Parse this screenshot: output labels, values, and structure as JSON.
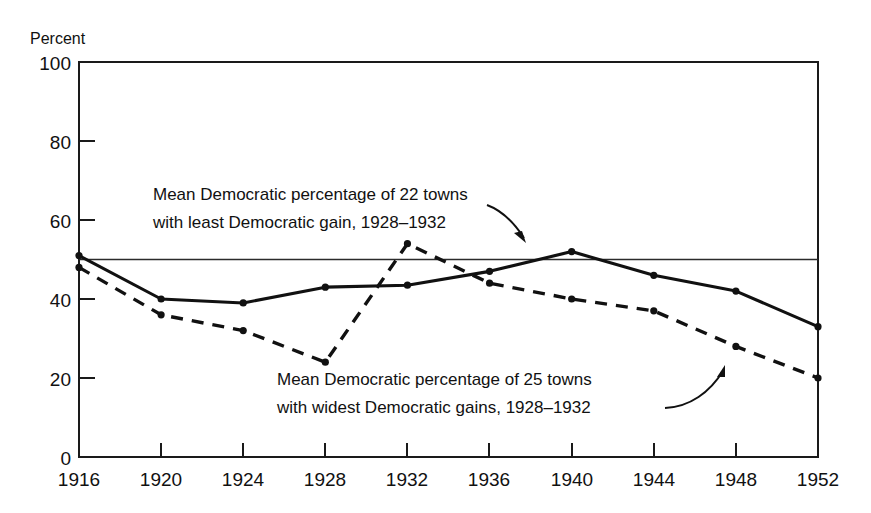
{
  "chart_data": {
    "type": "line",
    "title": "",
    "subtitle": "",
    "xlabel": "",
    "ylabel": "Percent",
    "ylim": [
      0,
      100
    ],
    "xlim": [
      1916,
      1952
    ],
    "grid": false,
    "legend_position": "annotations-inline",
    "x_tick_labels": [
      "1916",
      "1920",
      "1924",
      "1928",
      "1932",
      "1936",
      "1940",
      "1944",
      "1948",
      "1952"
    ],
    "y_tick_labels": [
      "0",
      "20",
      "40",
      "60",
      "80",
      "100"
    ],
    "x": [
      1916,
      1920,
      1924,
      1928,
      1932,
      1936,
      1940,
      1944,
      1948,
      1952
    ],
    "series": [
      {
        "name": "Mean Democratic percentage of 22 towns with least Democratic gain, 1928-1932",
        "style": "solid",
        "values": [
          51,
          40,
          39,
          43,
          43.5,
          47,
          52,
          46,
          42,
          33
        ]
      },
      {
        "name": "Mean Democratic percentage of 25 towns with widest Democratic gains, 1928-1932",
        "style": "dashed",
        "values": [
          48,
          36,
          32,
          24,
          54,
          44,
          40,
          37,
          28,
          20
        ]
      }
    ],
    "reference_lines": [
      {
        "name": "fifty-percent-line",
        "axis": "y",
        "value": 50
      }
    ],
    "annotations": [
      {
        "id": "annotation-least-gain",
        "line1": "Mean Democratic percentage of 22 towns",
        "line2": "with least Democratic gain, 1928–1932",
        "target_series": "solid"
      },
      {
        "id": "annotation-widest-gains",
        "line1": "Mean Democratic percentage of 25 towns",
        "line2": "with widest Democratic gains, 1928–1932",
        "target_series": "dashed"
      }
    ],
    "colors": {
      "ink": "#111111",
      "background": "#ffffff",
      "reference_line": "#2b2b2b"
    }
  },
  "axes": {
    "y_title": "Percent",
    "y_ticks": [
      {
        "label": "100",
        "value": 100
      },
      {
        "label": "80",
        "value": 80
      },
      {
        "label": "60",
        "value": 60
      },
      {
        "label": "40",
        "value": 40
      },
      {
        "label": "20",
        "value": 20
      },
      {
        "label": "0",
        "value": 0
      }
    ],
    "x_ticks": [
      {
        "label": "1916",
        "value": 1916
      },
      {
        "label": "1920",
        "value": 1920
      },
      {
        "label": "1924",
        "value": 1924
      },
      {
        "label": "1928",
        "value": 1928
      },
      {
        "label": "1932",
        "value": 1932
      },
      {
        "label": "1936",
        "value": 1936
      },
      {
        "label": "1940",
        "value": 1940
      },
      {
        "label": "1944",
        "value": 1944
      },
      {
        "label": "1948",
        "value": 1948
      },
      {
        "label": "1952",
        "value": 1952
      }
    ]
  },
  "annotations": {
    "least_gain": {
      "line1": "Mean Democratic percentage of 22 towns",
      "line2": "with least Democratic gain, 1928–1932"
    },
    "widest_gains": {
      "line1": "Mean Democratic percentage of 25 towns",
      "line2": "with widest Democratic gains, 1928–1932"
    }
  }
}
